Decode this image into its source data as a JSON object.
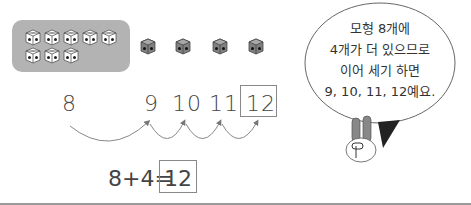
{
  "cubes": {
    "group_count": 8,
    "group_label": "모형 8개",
    "extra_count": 4,
    "group_color": "#b3b3b3",
    "extra_cube_color": "#777777"
  },
  "number_line": {
    "start": "8",
    "counts": [
      "9",
      "10",
      "11",
      "12"
    ],
    "highlighted": "12"
  },
  "equation": {
    "expression": "8+4=",
    "answer": "12"
  },
  "speech_bubble": {
    "lines": [
      "모형 8개에",
      "4개가 더 있으므로",
      "이어 세기 하면",
      "9, 10, 11, 12예요."
    ]
  },
  "character": {
    "icon": "rabbit-icon"
  }
}
